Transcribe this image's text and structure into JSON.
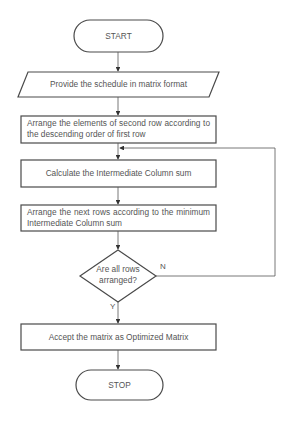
{
  "flowchart": {
    "start": {
      "label": "START"
    },
    "input": {
      "label": "Provide the schedule in matrix format"
    },
    "step1": {
      "label": "Arrange the elements of second row according to the descending order of first row"
    },
    "step2": {
      "label": "Calculate the Intermediate Column sum"
    },
    "step3": {
      "label": "Arrange the next rows according to the minimum Intermediate Column sum"
    },
    "decision": {
      "label": "Are all rows arranged?",
      "line1": "Are all rows",
      "line2": "arranged?",
      "yes_label": "Y",
      "no_label": "N"
    },
    "step4": {
      "label": "Accept the matrix as Optimized Matrix"
    },
    "stop": {
      "label": "STOP"
    }
  },
  "colors": {
    "stroke": "#4a4a4a",
    "text": "#555555",
    "background": "#ffffff"
  }
}
